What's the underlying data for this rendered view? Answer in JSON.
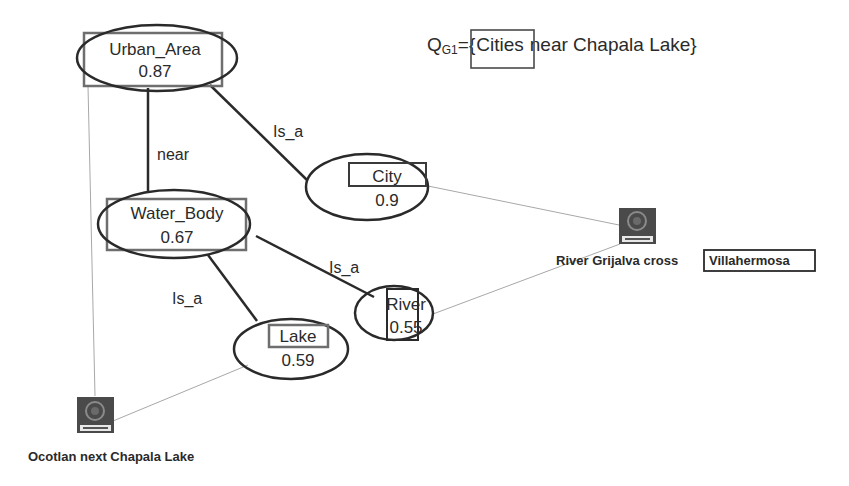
{
  "query": {
    "prefix": "Q",
    "subscript": "G1",
    "equals_brace": "={",
    "highlighted_term": "Cities",
    "rest": "near Chapala Lake}"
  },
  "nodes": {
    "urban_area": {
      "label": "Urban_Area",
      "score": "0.87",
      "boxed": true
    },
    "city": {
      "label": "City",
      "score": "0.9",
      "boxed": true
    },
    "water_body": {
      "label": "Water_Body",
      "score": "0.67",
      "boxed": true
    },
    "river": {
      "label": "River",
      "score": "0.55",
      "boxed": true
    },
    "lake": {
      "label": "Lake",
      "score": "0.59",
      "boxed": true
    }
  },
  "edges": [
    {
      "from": "urban_area",
      "to": "water_body",
      "label": "near"
    },
    {
      "from": "city",
      "to": "urban_area",
      "label": "Is_a"
    },
    {
      "from": "river",
      "to": "water_body",
      "label": "Is_a"
    },
    {
      "from": "lake",
      "to": "water_body",
      "label": "Is_a"
    }
  ],
  "instances": {
    "villahermosa": {
      "prefix": "River Grijalva cross",
      "highlighted": "Villahermosa",
      "icon": "chapala-seal-icon"
    },
    "ocotlan": {
      "label": "Ocotlan next Chapala Lake",
      "icon": "chapala-seal-icon"
    }
  },
  "colors": {
    "ellipse_stroke": "#2a2a2a",
    "highlight_box": "#6e6e6e",
    "thin_link": "#9a9a9a",
    "icon_bg": "#4a4a4a"
  }
}
